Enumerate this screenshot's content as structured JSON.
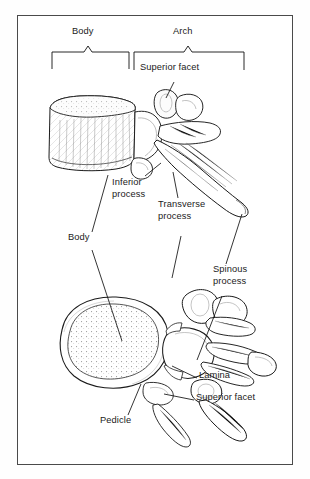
{
  "figure": {
    "border_color": "#4a4a4a",
    "background": "#ffffff",
    "ink_color": "#111111"
  },
  "brackets": [
    {
      "name": "body-bracket",
      "label": "Body",
      "x1": 52,
      "x2": 129,
      "y": 51,
      "leg_bottom": 69,
      "label_x": 72,
      "label_y": 33
    },
    {
      "name": "arch-bracket",
      "label": "Arch",
      "x1": 134,
      "x2": 244,
      "y": 51,
      "leg_bottom": 70,
      "label_x": 173,
      "label_y": 33
    }
  ],
  "labels": [
    {
      "name": "superior-facet-top",
      "text": "Superior facet",
      "x": 140,
      "y": 68
    },
    {
      "name": "inferior-process",
      "text": "Inferior\nprocess",
      "x": 112,
      "y": 182
    },
    {
      "name": "transverse-process",
      "text": "Transverse\nprocess",
      "x": 158,
      "y": 203
    },
    {
      "name": "body-label",
      "text": "Body",
      "x": 68,
      "y": 236
    },
    {
      "name": "spinous-process",
      "text": "Spinous\nprocess",
      "x": 213,
      "y": 268
    },
    {
      "name": "lamina",
      "text": "Lamina",
      "x": 199,
      "y": 374
    },
    {
      "name": "superior-facet-lower",
      "text": "Superior facet",
      "x": 196,
      "y": 395
    },
    {
      "name": "pedicle",
      "text": "Pedicle",
      "x": 100,
      "y": 419
    }
  ],
  "leaders": [
    {
      "name": "leader-superior-facet-top",
      "points": "174,82 166,98"
    },
    {
      "name": "leader-inferior-process",
      "points": "145,176 161,163"
    },
    {
      "name": "leader-transverse-process",
      "points": "178,198 173,172"
    },
    {
      "name": "leader-body-lateral",
      "points": "92,232 108,175"
    },
    {
      "name": "leader-body-superior",
      "points": "92,250 122,341"
    },
    {
      "name": "leader-spinous-lateral",
      "points": "226,264 242,214"
    },
    {
      "name": "leader-spinous-superior",
      "points": "222,296 197,360"
    },
    {
      "name": "leader-transverse-superior",
      "points": "181,236 172,278"
    },
    {
      "name": "leader-lamina",
      "points": "197,378 172,366"
    },
    {
      "name": "leader-superior-facet-lower",
      "points": "194,400 164,394"
    },
    {
      "name": "leader-pedicle",
      "points": "128,415 141,384"
    }
  ],
  "views": [
    {
      "name": "lateral-view",
      "description": "Lateral view of vertebra: body, processes, spinous process"
    },
    {
      "name": "superior-view",
      "description": "Superior view of vertebra: body, foramen, pedicle, lamina"
    }
  ]
}
